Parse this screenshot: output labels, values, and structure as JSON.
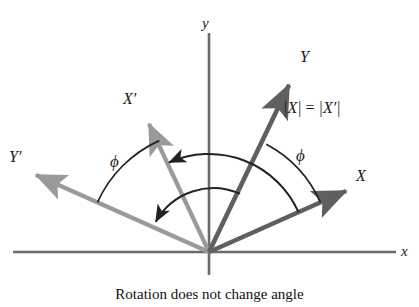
{
  "figure": {
    "caption": "Rotation does not change angle",
    "background_color": "#ffffff"
  },
  "axes": {
    "x_label": "x",
    "y_label": "y",
    "color": "#6b6b6b",
    "origin": {
      "x": 209,
      "y": 252
    },
    "x_start": {
      "x": 13,
      "y": 252
    },
    "x_end": {
      "x": 396,
      "y": 252
    },
    "y_start": {
      "x": 209,
      "y": 275
    },
    "y_end": {
      "x": 209,
      "y": 33
    }
  },
  "vectors": [
    {
      "name": "X",
      "label": "X",
      "color": "#5f5f5f",
      "angle_deg": 24,
      "tip": {
        "x": 352,
        "y": 188
      },
      "label_pos": {
        "x": 357,
        "y": 170
      }
    },
    {
      "name": "Y",
      "label": "Y",
      "color": "#5f5f5f",
      "angle_deg": 62,
      "tip": {
        "x": 293,
        "y": 78
      },
      "label_pos": {
        "x": 300,
        "y": 50
      }
    },
    {
      "name": "X-prime",
      "label": "X′",
      "color": "#9a9a9a",
      "angle_deg": 114,
      "tip": {
        "x": 145,
        "y": 118
      },
      "label_pos": {
        "x": 124,
        "y": 92
      }
    },
    {
      "name": "Y-prime",
      "label": "Y′",
      "color": "#9a9a9a",
      "angle_deg": 156,
      "tip": {
        "x": 30,
        "y": 172
      },
      "label_pos": {
        "x": 10,
        "y": 150
      }
    }
  ],
  "annotations": {
    "magnitude_equality": {
      "text": "|X| = |X′|",
      "parts": {
        "left": "|X|",
        "operator": " = ",
        "right": "|X′|"
      },
      "pos": {
        "x": 283,
        "y": 100
      }
    },
    "phi_right": {
      "symbol": "ϕ",
      "pos": {
        "x": 296,
        "y": 148
      },
      "description": "angle between X and Y"
    },
    "phi_left": {
      "symbol": "ϕ",
      "pos": {
        "x": 111,
        "y": 154
      },
      "description": "angle between X-prime and Y-prime"
    }
  },
  "arcs": {
    "color": "#222222",
    "outer_rotation": {
      "name": "X-to-X-prime rotation arc",
      "radius": 98,
      "from_deg": 24,
      "to_deg": 114,
      "arrow_at": "X-prime end"
    },
    "inner_rotation": {
      "name": "Y-to-Y-prime rotation arc",
      "radius": 66,
      "from_deg": 62,
      "to_deg": 156,
      "arrow_at": "Y-prime end"
    },
    "phi_right_arc": {
      "name": "phi angle arc between X and Y",
      "radius": 122,
      "from_deg": 24,
      "to_deg": 62
    },
    "phi_left_arc": {
      "name": "phi angle arc between X-prime and Y-prime",
      "radius": 122,
      "from_deg": 114,
      "to_deg": 156
    }
  }
}
